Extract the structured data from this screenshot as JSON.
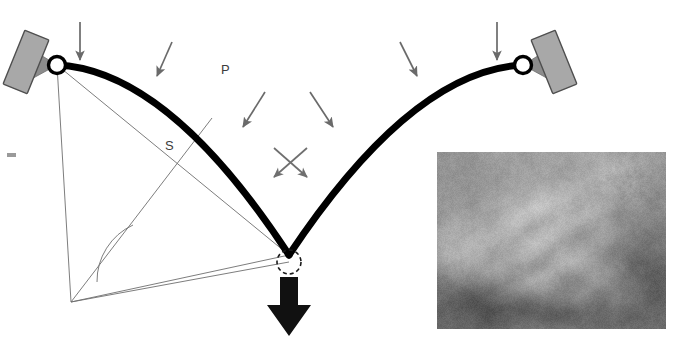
{
  "figure": {
    "type": "engineering-mechanics-diagram",
    "background_color": "#ffffff"
  },
  "labels": {
    "load_label": "P",
    "span_label": "S"
  },
  "colors": {
    "arch_stroke": "#000000",
    "geometry_line": "#6e6e6e",
    "arrow_gray": "#6a6a6a",
    "support_plate_fill": "#a8a8a8",
    "support_plate_stroke": "#555555",
    "support_wedge_fill": "#8c8c8c",
    "load_arrow_black": "#111111",
    "joint_fill": "#ffffff",
    "joint_stroke": "#000000",
    "edge_mark": "#9a9a9a"
  },
  "geometry": {
    "left_pin": {
      "x": 57,
      "y": 65
    },
    "right_pin": {
      "x": 523,
      "y": 65
    },
    "apex": {
      "x": 289,
      "y": 255
    },
    "lower_left_vertex": {
      "x": 71,
      "y": 302
    },
    "arch_tangent_point": {
      "x": 212,
      "y": 118
    },
    "angle_arc_radius": 62,
    "dashed_circle_radius": 12,
    "arch_stroke_width": 7,
    "geometry_stroke_width": 0.9
  },
  "supports": [
    {
      "name": "left-support",
      "plate_cx": 26,
      "plate_cy": 62,
      "plate_w": 26,
      "plate_h": 58,
      "rotation_deg": 22,
      "wedge_tip_x": 57,
      "wedge_tip_y": 65
    },
    {
      "name": "right-support",
      "plate_cx": 553,
      "plate_cy": 62,
      "plate_w": 26,
      "plate_h": 58,
      "rotation_deg": -22,
      "wedge_tip_x": 523,
      "wedge_tip_y": 65
    }
  ],
  "load_arrows": [
    {
      "name": "load-arrow-1",
      "x1": 80,
      "y1": 22,
      "x2": 80,
      "y2": 60
    },
    {
      "name": "load-arrow-2",
      "x1": 172,
      "y1": 42,
      "x2": 157,
      "y2": 76
    },
    {
      "name": "load-arrow-3",
      "x1": 265,
      "y1": 92,
      "x2": 243,
      "y2": 127
    },
    {
      "name": "load-arrow-4",
      "x1": 310,
      "y1": 92,
      "x2": 333,
      "y2": 127
    },
    {
      "name": "load-arrow-5",
      "x1": 400,
      "y1": 42,
      "x2": 417,
      "y2": 76
    },
    {
      "name": "load-arrow-6",
      "x1": 497,
      "y1": 22,
      "x2": 497,
      "y2": 60
    }
  ],
  "cross_arrows": [
    {
      "name": "cross-arrow-down-left",
      "x1": 307,
      "y1": 148,
      "x2": 274,
      "y2": 177
    },
    {
      "name": "cross-arrow-down-right",
      "x1": 274,
      "y1": 148,
      "x2": 307,
      "y2": 177
    }
  ],
  "reaction_arrow": {
    "name": "thrust-arrow",
    "shaft_x": 289,
    "shaft_top": 277,
    "shaft_bottom": 305,
    "shaft_width": 18,
    "head_half_width": 22,
    "tip_y": 336
  },
  "photo": {
    "name": "anatomical-photo-inset",
    "x": 437,
    "y": 152,
    "width": 229,
    "height": 177,
    "kind": "grayscale-endoscopic-photograph"
  },
  "edge_mark": {
    "x": 7,
    "y": 153,
    "width": 9,
    "height": 4
  }
}
